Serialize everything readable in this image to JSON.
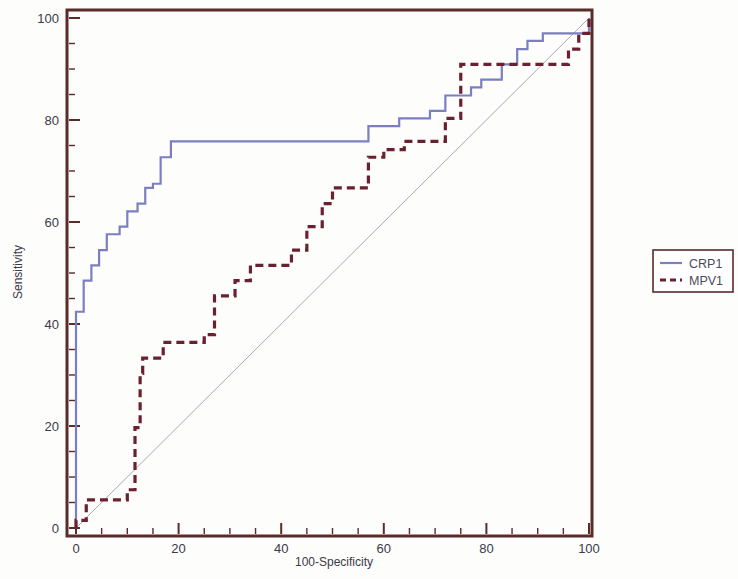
{
  "chart_data": {
    "type": "line",
    "title": "",
    "xlabel": "100-Specificity",
    "ylabel": "Sensitivity",
    "xlim": [
      0,
      100
    ],
    "ylim": [
      0,
      100
    ],
    "grid": false,
    "legend_position": "right",
    "x_ticks": [
      0,
      20,
      40,
      60,
      80,
      100
    ],
    "x_tick_labels": [
      "0",
      "20",
      "40",
      "60",
      "80",
      "100"
    ],
    "x_minor_tick_interval": 5,
    "y_ticks": [
      0,
      20,
      40,
      60,
      80,
      100
    ],
    "y_tick_labels": [
      "0",
      "20",
      "40",
      "60",
      "80",
      "100"
    ],
    "y_minor_tick_interval": 5,
    "reference_line": {
      "name": "chance-diagonal",
      "points": [
        [
          0,
          0
        ],
        [
          100,
          100
        ]
      ],
      "color": "#9a9ab0",
      "style": "thin-solid"
    },
    "series": [
      {
        "name": "CRP1",
        "color": "#7b7fc0",
        "style": "solid",
        "step": true,
        "points": [
          [
            0,
            0
          ],
          [
            0,
            42.4
          ],
          [
            1.5,
            42.4
          ],
          [
            1.5,
            48.5
          ],
          [
            3,
            48.5
          ],
          [
            3,
            51.5
          ],
          [
            4.5,
            51.5
          ],
          [
            4.5,
            54.5
          ],
          [
            6,
            54.5
          ],
          [
            6,
            57.6
          ],
          [
            8.5,
            57.6
          ],
          [
            8.5,
            59.1
          ],
          [
            10,
            59.1
          ],
          [
            10,
            62.1
          ],
          [
            12,
            62.1
          ],
          [
            12,
            63.6
          ],
          [
            13.5,
            63.6
          ],
          [
            13.5,
            66.7
          ],
          [
            15,
            66.7
          ],
          [
            15,
            67.5
          ],
          [
            16.5,
            67.5
          ],
          [
            16.5,
            72.7
          ],
          [
            18.5,
            72.7
          ],
          [
            18.5,
            75.8
          ],
          [
            20,
            75.8
          ],
          [
            57,
            75.8
          ],
          [
            57,
            78.8
          ],
          [
            63,
            78.8
          ],
          [
            63,
            80.3
          ],
          [
            69,
            80.3
          ],
          [
            69,
            81.8
          ],
          [
            72,
            81.8
          ],
          [
            72,
            84.8
          ],
          [
            77,
            84.8
          ],
          [
            77,
            86.4
          ],
          [
            79,
            86.4
          ],
          [
            79,
            87.9
          ],
          [
            83,
            87.9
          ],
          [
            83,
            90.9
          ],
          [
            86,
            90.9
          ],
          [
            86,
            93.9
          ],
          [
            88,
            93.9
          ],
          [
            88,
            95.5
          ],
          [
            91,
            95.5
          ],
          [
            91,
            97.0
          ],
          [
            100,
            97.0
          ],
          [
            100,
            100
          ]
        ]
      },
      {
        "name": "MPV1",
        "color": "#6b2030",
        "style": "dashed",
        "step": true,
        "points": [
          [
            0,
            0
          ],
          [
            0,
            1.5
          ],
          [
            2,
            1.5
          ],
          [
            2,
            5.5
          ],
          [
            3,
            5.5
          ],
          [
            10,
            5.5
          ],
          [
            10,
            7.5
          ],
          [
            11.5,
            7.5
          ],
          [
            11.5,
            19.7
          ],
          [
            12.5,
            19.7
          ],
          [
            12.5,
            30.3
          ],
          [
            13,
            30.3
          ],
          [
            13,
            33.3
          ],
          [
            17,
            33.3
          ],
          [
            17,
            36.4
          ],
          [
            25,
            36.4
          ],
          [
            25,
            37.9
          ],
          [
            27,
            37.9
          ],
          [
            27,
            45.5
          ],
          [
            31,
            45.5
          ],
          [
            31,
            48.5
          ],
          [
            34,
            48.5
          ],
          [
            34,
            51.5
          ],
          [
            42,
            51.5
          ],
          [
            42,
            54.5
          ],
          [
            45,
            54.5
          ],
          [
            45,
            59.1
          ],
          [
            48,
            59.1
          ],
          [
            48,
            63.6
          ],
          [
            50,
            63.6
          ],
          [
            50,
            66.7
          ],
          [
            57,
            66.7
          ],
          [
            57,
            72.7
          ],
          [
            60,
            72.7
          ],
          [
            60,
            74.2
          ],
          [
            64,
            74.2
          ],
          [
            64,
            75.8
          ],
          [
            72,
            75.8
          ],
          [
            72,
            80.3
          ],
          [
            75,
            80.3
          ],
          [
            75,
            90.9
          ],
          [
            77,
            90.9
          ],
          [
            96,
            90.9
          ],
          [
            96,
            93.9
          ],
          [
            98,
            93.9
          ],
          [
            98,
            97.0
          ],
          [
            100,
            97.0
          ],
          [
            100,
            100
          ]
        ]
      }
    ]
  },
  "legend": {
    "entries": [
      {
        "label": "CRP1",
        "swatch": "solid-line-swatch"
      },
      {
        "label": "MPV1",
        "swatch": "dashed-line-swatch"
      }
    ]
  },
  "colors": {
    "axis": "#5a2b2b",
    "crp1": "#7b7fc0",
    "mpv1": "#6b2030",
    "diagonal": "#9a9ab0",
    "text": "#3a3a4a",
    "background": "#fdfdfb"
  }
}
